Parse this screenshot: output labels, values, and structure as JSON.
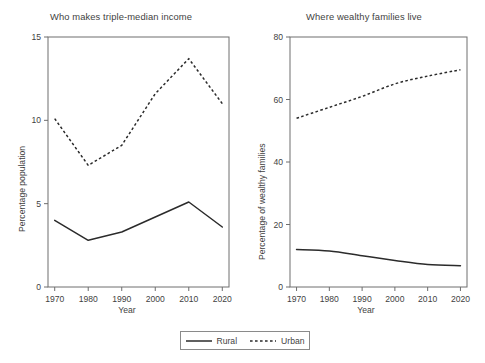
{
  "figure": {
    "legend": {
      "position": "bottom-center",
      "entries": [
        {
          "label": "Rural",
          "style": "solid",
          "icon": "solid-line-icon"
        },
        {
          "label": "Urban",
          "style": "dashed",
          "icon": "dashed-line-icon"
        }
      ]
    }
  },
  "chart_data": [
    {
      "type": "line",
      "title": "Who makes triple-median income",
      "xlabel": "Year",
      "ylabel": "Percentage population",
      "x": [
        1970,
        1980,
        1990,
        2000,
        2010,
        2020
      ],
      "xticklabels": [
        "1970",
        "1980",
        "1990",
        "2000",
        "2010",
        "2020"
      ],
      "yticks": [
        0,
        5,
        10,
        15
      ],
      "yticklabels": [
        "0",
        "5",
        "10",
        "15"
      ],
      "xlim": [
        1968,
        2022
      ],
      "ylim": [
        0,
        15
      ],
      "grid": false,
      "legend_position": "figure-bottom",
      "series": [
        {
          "name": "Rural",
          "style": "solid",
          "values": [
            4.0,
            2.8,
            3.3,
            4.2,
            5.1,
            3.6
          ]
        },
        {
          "name": "Urban",
          "style": "dashed",
          "values": [
            10.1,
            7.3,
            8.5,
            11.6,
            13.7,
            11.0
          ]
        }
      ]
    },
    {
      "type": "line",
      "title": "Where wealthy families live",
      "xlabel": "Year",
      "ylabel": "Percentage of wealthy families",
      "x": [
        1970,
        1980,
        1990,
        2000,
        2010,
        2020
      ],
      "xticklabels": [
        "1970",
        "1980",
        "1990",
        "2000",
        "2010",
        "2020"
      ],
      "yticks": [
        0,
        20,
        40,
        60,
        80
      ],
      "yticklabels": [
        "0",
        "20",
        "40",
        "60",
        "80"
      ],
      "xlim": [
        1968,
        2022
      ],
      "ylim": [
        0,
        80
      ],
      "grid": false,
      "legend_position": "figure-bottom",
      "series": [
        {
          "name": "Rural",
          "style": "solid",
          "values": [
            12.0,
            11.5,
            10.0,
            8.5,
            7.2,
            6.8
          ]
        },
        {
          "name": "Urban",
          "style": "dashed",
          "values": [
            54.0,
            57.5,
            61.0,
            65.0,
            67.5,
            69.5
          ]
        }
      ]
    }
  ]
}
